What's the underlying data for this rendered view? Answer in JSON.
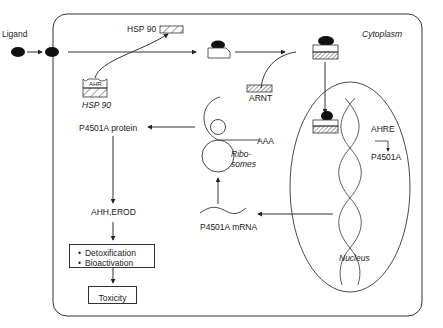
{
  "diagram": {
    "compartments": {
      "cytoplasm": "Cytoplasm",
      "nucleus": "Nucleus"
    },
    "labels": {
      "ligand": "Ligand",
      "hsp90_top": "HSP 90",
      "hsp90_bottom": "HSP 90",
      "ahr": "AHR",
      "arnt": "ARNT",
      "ahre": "AHRE",
      "p4501a_gene": "P4501A",
      "aaa": "AAA",
      "ribosomes_line1": "Ribo-",
      "ribosomes_line2": "somes",
      "p4501a_protein": "P4501A protein",
      "p4501a_mrna": "P4501A mRNA",
      "ahh_erod": "AHH,EROD",
      "toxicity": "Toxicity"
    },
    "effects_list": [
      "Detoxification",
      "Bioactivation"
    ],
    "colors": {
      "stroke": "#333333",
      "ligand_fill": "#111111",
      "background": "#ffffff"
    }
  }
}
